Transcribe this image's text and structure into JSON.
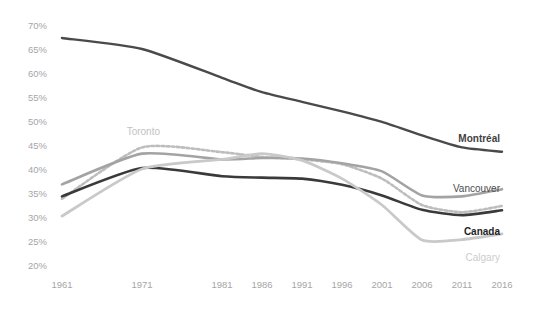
{
  "chart_data": {
    "type": "line",
    "title": "",
    "subtitle": "",
    "xlabel": "",
    "ylabel": "",
    "x": [
      1961,
      1971,
      1981,
      1986,
      1991,
      1996,
      2001,
      2006,
      2011,
      2016
    ],
    "x_tick_labels": [
      "1961",
      "1971",
      "1981",
      "1986",
      "1991",
      "1996",
      "2001",
      "2006",
      "2011",
      "2016"
    ],
    "y_tick_labels": [
      "70%",
      "65%",
      "60%",
      "55%",
      "50%",
      "45%",
      "40%",
      "35%",
      "30%",
      "25%",
      "20%"
    ],
    "y_ticks": [
      70,
      65,
      60,
      55,
      50,
      45,
      40,
      35,
      30,
      25,
      20
    ],
    "ylim": [
      20,
      70
    ],
    "xlim": [
      1961,
      2016
    ],
    "grid": false,
    "legend_position": "inline-right",
    "value_unit": "percent",
    "series": [
      {
        "name": "Montréal",
        "color": "#4a4a4a",
        "style": "solid",
        "width": 2.4,
        "label_bold": true,
        "label_color": "#3f3f3f",
        "values": [
          67.3,
          65.0,
          59.0,
          56.0,
          54.0,
          52.0,
          49.8,
          47.0,
          44.5,
          43.6
        ]
      },
      {
        "name": "Toronto",
        "color": "#bdbdbd",
        "style": "dotted",
        "width": 2.6,
        "label_bold": false,
        "label_color": "#c2c2c2",
        "values": [
          33.8,
          44.5,
          43.5,
          42.5,
          42.0,
          41.0,
          38.0,
          32.5,
          31.0,
          32.3
        ]
      },
      {
        "name": "Vancouver",
        "color": "#a3a3a3",
        "style": "solid",
        "width": 2.6,
        "label_bold": false,
        "label_color": "#4d4d4d",
        "values": [
          36.8,
          43.2,
          42.0,
          42.3,
          42.2,
          41.2,
          39.5,
          34.5,
          34.3,
          35.8
        ]
      },
      {
        "name": "Canada",
        "color": "#3a3a3a",
        "style": "solid",
        "width": 2.6,
        "label_bold": true,
        "label_color": "#1f1f1f",
        "values": [
          34.3,
          40.2,
          38.5,
          38.2,
          38.0,
          36.7,
          34.5,
          31.5,
          30.4,
          31.4
        ]
      },
      {
        "name": "Calgary",
        "color": "#c9c9c9",
        "style": "solid",
        "width": 2.8,
        "label_bold": false,
        "label_color": "#cccccc",
        "values": [
          30.2,
          40.0,
          42.0,
          43.2,
          41.8,
          38.0,
          32.5,
          25.2,
          25.3,
          26.5
        ]
      }
    ],
    "series_labels": [
      {
        "name": "Montréal",
        "x": 500,
        "y": 142
      },
      {
        "name": "Toronto",
        "x": 160,
        "y": 135
      },
      {
        "name": "Vancouver",
        "x": 500,
        "y": 192
      },
      {
        "name": "Canada",
        "x": 500,
        "y": 235
      },
      {
        "name": "Calgary",
        "x": 500,
        "y": 261
      }
    ]
  }
}
